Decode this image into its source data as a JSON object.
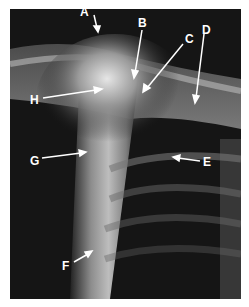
{
  "figure": {
    "labels": [
      {
        "id": "A",
        "text": "A"
      },
      {
        "id": "B",
        "text": "B"
      },
      {
        "id": "C",
        "text": "C"
      },
      {
        "id": "D",
        "text": "D"
      },
      {
        "id": "E",
        "text": "E"
      },
      {
        "id": "F",
        "text": "F"
      },
      {
        "id": "G",
        "text": "G"
      },
      {
        "id": "H",
        "text": "H"
      }
    ],
    "colors": {
      "background": "#ffffff",
      "film_dark": "#111111",
      "bone": "#d8d8d8",
      "annotation": "#ffffff"
    }
  }
}
